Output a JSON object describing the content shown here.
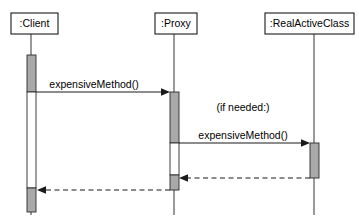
{
  "diagram": {
    "type": "uml-sequence-diagram",
    "canvas": {
      "width": 359,
      "height": 221,
      "background": "#ffffff"
    },
    "colors": {
      "activation_fill": "#a9a9a9",
      "activation_hollow_fill": "#ffffff",
      "line": "#1a1a1a",
      "lifeline": "#555555",
      "box_fill": "#ffffff",
      "text": "#000000"
    },
    "lifelines": [
      {
        "id": "client",
        "label": ":Client",
        "box": {
          "x": 11,
          "y": 13,
          "width": 47,
          "height": 21
        },
        "line_x": 31,
        "line_top": 34,
        "line_bottom": 215
      },
      {
        "id": "proxy",
        "label": ":Proxy",
        "box": {
          "x": 155,
          "y": 13,
          "width": 42,
          "height": 21
        },
        "line_x": 174,
        "line_top": 34,
        "line_bottom": 215
      },
      {
        "id": "realactiveclass",
        "label": ":RealActiveClass",
        "box": {
          "x": 265,
          "y": 13,
          "width": 89,
          "height": 21
        },
        "line_x": 314,
        "line_top": 34,
        "line_bottom": 215
      }
    ],
    "activations": [
      {
        "id": "client-act-1",
        "lifeline": "client",
        "x": 27,
        "y": 55,
        "width": 9,
        "height": 37,
        "filled": true
      },
      {
        "id": "client-act-2",
        "lifeline": "client",
        "x": 27,
        "y": 92,
        "width": 9,
        "height": 96,
        "filled": false
      },
      {
        "id": "client-act-3",
        "lifeline": "client",
        "x": 27,
        "y": 188,
        "width": 9,
        "height": 24,
        "filled": true
      },
      {
        "id": "proxy-act-1",
        "lifeline": "proxy",
        "x": 170,
        "y": 92,
        "width": 9,
        "height": 51,
        "filled": true
      },
      {
        "id": "proxy-act-2",
        "lifeline": "proxy",
        "x": 170,
        "y": 143,
        "width": 9,
        "height": 32,
        "filled": false
      },
      {
        "id": "proxy-act-3",
        "lifeline": "proxy",
        "x": 170,
        "y": 175,
        "width": 9,
        "height": 15,
        "filled": true
      },
      {
        "id": "real-act-1",
        "lifeline": "realactiveclass",
        "x": 310,
        "y": 143,
        "width": 9,
        "height": 35,
        "filled": true
      }
    ],
    "messages": [
      {
        "id": "msg-1",
        "label": "expensiveMethod()",
        "from": "client",
        "to": "proxy",
        "x1": 36,
        "x2": 170,
        "y": 92,
        "style": "solid",
        "direction": "right",
        "label_x": 94,
        "label_y": 88
      },
      {
        "id": "msg-2",
        "label": "expensiveMethod()",
        "note": "(if needed:)",
        "from": "proxy",
        "to": "realactiveclass",
        "x1": 179,
        "x2": 310,
        "y": 143,
        "style": "solid",
        "direction": "right",
        "label_x": 243,
        "label_y": 139,
        "note_x": 243,
        "note_y": 111
      },
      {
        "id": "msg-3-return",
        "label": "",
        "from": "realactiveclass",
        "to": "proxy",
        "x1": 310,
        "x2": 179,
        "y": 178,
        "style": "dashed",
        "direction": "left"
      },
      {
        "id": "msg-4-return",
        "label": "",
        "from": "proxy",
        "to": "client",
        "x1": 170,
        "x2": 37,
        "y": 190,
        "style": "dashed",
        "direction": "left"
      }
    ],
    "annotations": [
      {
        "id": "if-needed-note",
        "text": "(if needed:)"
      }
    ]
  }
}
